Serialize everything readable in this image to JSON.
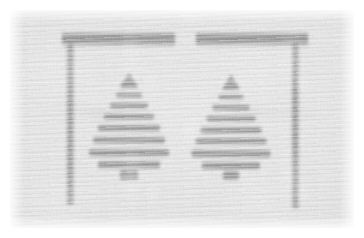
{
  "image": {
    "title": "Degraded grayscale textile image",
    "description": "Heavily noised light-gray woven/canvas texture bearing a dark bracket-shaped frame enclosing two triangular tree-like motifs",
    "width": 364,
    "height": 238,
    "medium": "woven fabric texture",
    "palette": {
      "paper": "#ffffff",
      "ground_light": "#e6e6e6",
      "ground_mid": "#d9d9d9",
      "ground_dark": "#cfcfcf",
      "mark_dark": "#3a3a3a",
      "mark_darkest": "#202020"
    },
    "margin_px": 10
  },
  "motifs": {
    "frame": {
      "name": "bracket-frame",
      "bars": [
        {
          "label": "top-bar-left",
          "x": 52,
          "y": 22,
          "w": 113,
          "h": 15
        },
        {
          "label": "top-bar-right",
          "x": 186,
          "y": 22,
          "w": 112,
          "h": 15
        }
      ],
      "posts": [
        {
          "label": "left-post",
          "x": 56,
          "y": 30,
          "w": 9,
          "h": 165
        },
        {
          "label": "right-post",
          "x": 281,
          "y": 30,
          "w": 9,
          "h": 168
        }
      ]
    },
    "trees": [
      {
        "label": "tree-left",
        "center_x": 119,
        "top_y": 72,
        "base_y": 160,
        "rows": [
          {
            "w": 16,
            "h": 6,
            "y": 0
          },
          {
            "w": 26,
            "h": 6,
            "y": 10
          },
          {
            "w": 38,
            "h": 7,
            "y": 20
          },
          {
            "w": 50,
            "h": 7,
            "y": 31
          },
          {
            "w": 62,
            "h": 8,
            "y": 42
          },
          {
            "w": 72,
            "h": 8,
            "y": 54
          },
          {
            "w": 80,
            "h": 9,
            "y": 66
          },
          {
            "w": 62,
            "h": 9,
            "y": 78
          }
        ],
        "trunk": {
          "w": 18,
          "h": 10,
          "y": 88
        }
      },
      {
        "label": "tree-right",
        "center_x": 221,
        "top_y": 72,
        "base_y": 160,
        "rows": [
          {
            "w": 15,
            "h": 6,
            "y": 2
          },
          {
            "w": 25,
            "h": 6,
            "y": 12
          },
          {
            "w": 37,
            "h": 7,
            "y": 22
          },
          {
            "w": 49,
            "h": 7,
            "y": 33
          },
          {
            "w": 61,
            "h": 8,
            "y": 44
          },
          {
            "w": 71,
            "h": 8,
            "y": 55
          },
          {
            "w": 79,
            "h": 9,
            "y": 67
          },
          {
            "w": 58,
            "h": 9,
            "y": 79
          }
        ],
        "trunk": {
          "w": 16,
          "h": 9,
          "y": 89
        }
      }
    ]
  }
}
